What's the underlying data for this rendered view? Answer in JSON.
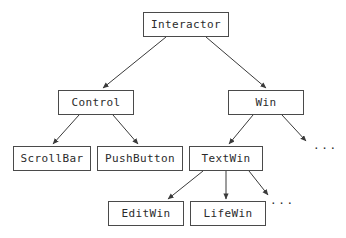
{
  "diagram": {
    "type": "tree",
    "background_color": "#ffffff",
    "box_border_color": "#4a4a4a",
    "edge_color": "#3a3a3a",
    "text_color": "#2b2b2b",
    "nodes": [
      {
        "id": "interactor",
        "label": "Interactor",
        "x": 143,
        "y": 12,
        "w": 86,
        "h": 25,
        "level": 0
      },
      {
        "id": "control",
        "label": "Control",
        "x": 58,
        "y": 90,
        "w": 76,
        "h": 25,
        "level": 1
      },
      {
        "id": "win",
        "label": "Win",
        "x": 228,
        "y": 90,
        "w": 76,
        "h": 25,
        "level": 1
      },
      {
        "id": "scrollbar",
        "label": "ScrollBar",
        "x": 13,
        "y": 146,
        "w": 78,
        "h": 25,
        "level": 2
      },
      {
        "id": "pushbutton",
        "label": "PushButton",
        "x": 97,
        "y": 146,
        "w": 86,
        "h": 25,
        "level": 2
      },
      {
        "id": "textwin",
        "label": "TextWin",
        "x": 189,
        "y": 146,
        "w": 74,
        "h": 25,
        "level": 2
      },
      {
        "id": "editwin",
        "label": "EditWin",
        "x": 108,
        "y": 201,
        "w": 76,
        "h": 25,
        "level": 3
      },
      {
        "id": "lifewin",
        "label": "LifeWin",
        "x": 190,
        "y": 201,
        "w": 76,
        "h": 25,
        "level": 3
      }
    ],
    "ellipses": [
      {
        "id": "win-more",
        "label": "...",
        "x": 313,
        "y": 140
      },
      {
        "id": "textwin-more",
        "label": "...",
        "x": 270,
        "y": 195
      }
    ],
    "edges": [
      {
        "from": "interactor",
        "to": "control",
        "x1": 166,
        "y1": 37,
        "x2": 103,
        "y2": 88
      },
      {
        "from": "interactor",
        "to": "win",
        "x1": 206,
        "y1": 37,
        "x2": 266,
        "y2": 88
      },
      {
        "from": "control",
        "to": "scrollbar",
        "x1": 79,
        "y1": 115,
        "x2": 53,
        "y2": 144
      },
      {
        "from": "control",
        "to": "pushbutton",
        "x1": 113,
        "y1": 115,
        "x2": 138,
        "y2": 144
      },
      {
        "from": "win",
        "to": "textwin",
        "x1": 253,
        "y1": 115,
        "x2": 229,
        "y2": 144
      },
      {
        "from": "win",
        "to": "win-more",
        "x1": 282,
        "y1": 115,
        "x2": 306,
        "y2": 141
      },
      {
        "from": "textwin",
        "to": "editwin",
        "x1": 203,
        "y1": 171,
        "x2": 168,
        "y2": 199
      },
      {
        "from": "textwin",
        "to": "lifewin",
        "x1": 226,
        "y1": 171,
        "x2": 226,
        "y2": 199
      },
      {
        "from": "textwin",
        "to": "textwin-more",
        "x1": 249,
        "y1": 171,
        "x2": 268,
        "y2": 195
      }
    ]
  }
}
